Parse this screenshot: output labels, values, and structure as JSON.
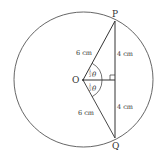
{
  "diagram": {
    "type": "circle-geometry",
    "points": {
      "O": {
        "label": "O"
      },
      "P": {
        "label": "P"
      },
      "Q": {
        "label": "Q"
      }
    },
    "segments": {
      "OP": {
        "label": "6 cm"
      },
      "OQ": {
        "label": "6 cm"
      },
      "P_mid": {
        "label": "4 cm"
      },
      "mid_Q": {
        "label": "4 cm"
      }
    },
    "angles": {
      "upper": {
        "label_num": "1",
        "label_den": "2",
        "label_sym": "θ"
      },
      "lower": {
        "label_num": "1",
        "label_den": "2",
        "label_sym": "θ"
      }
    },
    "colors": {
      "stroke": "#333333",
      "circle": "#555555"
    }
  }
}
